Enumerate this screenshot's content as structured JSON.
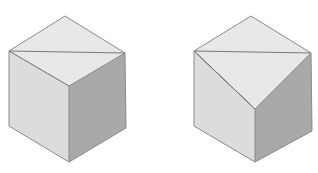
{
  "colors": {
    "top_face": "#e8e8e8",
    "left_face": "#dcdcdc",
    "right_face": "#a9a9a9",
    "edge": "#8a8a8a",
    "background": "#ffffff"
  },
  "cubes": [
    {
      "name": "cube-left",
      "vertices": {
        "top": [
          65,
          16
        ],
        "left": [
          9,
          51
        ],
        "right": [
          125,
          53
        ],
        "center": [
          69,
          86
        ],
        "bottom_left": [
          9,
          126
        ],
        "bottom": [
          69,
          162
        ],
        "bottom_right": [
          126,
          128
        ]
      },
      "cut_line": [
        [
          9,
          51
        ],
        [
          125,
          53
        ]
      ]
    },
    {
      "name": "cube-right",
      "vertices": {
        "top": [
          251,
          16
        ],
        "left": [
          194,
          51
        ],
        "right": [
          311,
          53
        ],
        "center": [
          255,
          109
        ],
        "bottom_left": [
          194,
          126
        ],
        "bottom": [
          255,
          162
        ],
        "bottom_right": [
          312,
          131
        ]
      },
      "cut_line": [
        [
          194,
          51
        ],
        [
          311,
          53
        ]
      ],
      "cut_line_2": [
        [
          194,
          51
        ],
        [
          255,
          109
        ]
      ]
    }
  ]
}
